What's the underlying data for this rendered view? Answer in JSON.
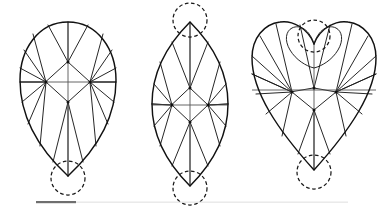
{
  "figure": {
    "background_color": "#ffffff",
    "outline_color": "#111111",
    "facet_color": "#1a1a1a",
    "axis_color": "#555555",
    "guide_circle_color": "#1a1a1a",
    "shapes": [
      {
        "id": "pear",
        "name": "Pear cut",
        "label": "",
        "center_x": 68,
        "outline_path": "M 68 22 C 98 22 116 50 116 80 C 116 118 96 150 68 176 C 40 150 20 118 20 80 C 20 50 38 22 68 22 Z",
        "nodes": [
          {
            "name": "upper-node",
            "x": 68,
            "y": 62
          },
          {
            "name": "left-node",
            "x": 46,
            "y": 82
          },
          {
            "name": "right-node",
            "x": 90,
            "y": 82
          },
          {
            "name": "lower-node",
            "x": 68,
            "y": 102
          }
        ],
        "guide_circles": [
          {
            "name": "bottom-point-circle",
            "cx": 68,
            "cy": 178,
            "r": 17
          }
        ],
        "axes": [
          {
            "name": "vertical-axis",
            "x1": 68,
            "y1": 22,
            "x2": 68,
            "y2": 177
          },
          {
            "name": "horizontal-axis",
            "x1": 20,
            "y1": 82,
            "x2": 116,
            "y2": 82
          }
        ],
        "rim_points_upper": [
          {
            "x": 68,
            "y": 22
          },
          {
            "x": 88,
            "y": 25
          },
          {
            "x": 103,
            "y": 34
          },
          {
            "x": 112,
            "y": 50
          },
          {
            "x": 116,
            "y": 68
          },
          {
            "x": 116,
            "y": 82
          },
          {
            "x": 20,
            "y": 82
          },
          {
            "x": 20,
            "y": 68
          },
          {
            "x": 24,
            "y": 50
          },
          {
            "x": 33,
            "y": 34
          },
          {
            "x": 48,
            "y": 25
          }
        ],
        "rim_points_lower": [
          {
            "x": 116,
            "y": 82
          },
          {
            "x": 114,
            "y": 102
          },
          {
            "x": 108,
            "y": 124
          },
          {
            "x": 96,
            "y": 146
          },
          {
            "x": 83,
            "y": 162
          },
          {
            "x": 68,
            "y": 176
          },
          {
            "x": 53,
            "y": 162
          },
          {
            "x": 40,
            "y": 146
          },
          {
            "x": 28,
            "y": 124
          },
          {
            "x": 22,
            "y": 102
          },
          {
            "x": 20,
            "y": 82
          }
        ]
      },
      {
        "id": "marquise",
        "name": "Marquise (navette) cut",
        "label": "",
        "center_x": 190,
        "outline_path": "M 190 22 C 216 48 228 76 228 104 C 228 132 216 160 190 186 C 164 160 152 132 152 104 C 152 76 164 48 190 22 Z",
        "nodes": [
          {
            "name": "upper-node",
            "x": 190,
            "y": 88
          },
          {
            "name": "left-node",
            "x": 172,
            "y": 105
          },
          {
            "name": "right-node",
            "x": 208,
            "y": 105
          },
          {
            "name": "lower-node",
            "x": 190,
            "y": 122
          }
        ],
        "guide_circles": [
          {
            "name": "top-point-circle",
            "cx": 190,
            "cy": 20,
            "r": 17
          },
          {
            "name": "bottom-point-circle",
            "cx": 190,
            "cy": 188,
            "r": 17
          }
        ],
        "axes": [
          {
            "name": "vertical-axis",
            "x1": 190,
            "y1": 22,
            "x2": 190,
            "y2": 186
          },
          {
            "name": "horizontal-axis",
            "x1": 152,
            "y1": 105,
            "x2": 228,
            "y2": 105
          }
        ],
        "rim_points_upper": [
          {
            "x": 190,
            "y": 22
          },
          {
            "x": 208,
            "y": 42
          },
          {
            "x": 220,
            "y": 62
          },
          {
            "x": 226,
            "y": 84
          },
          {
            "x": 228,
            "y": 104
          },
          {
            "x": 152,
            "y": 104
          },
          {
            "x": 154,
            "y": 84
          },
          {
            "x": 160,
            "y": 62
          },
          {
            "x": 172,
            "y": 42
          }
        ],
        "rim_points_lower": [
          {
            "x": 228,
            "y": 104
          },
          {
            "x": 226,
            "y": 126
          },
          {
            "x": 220,
            "y": 146
          },
          {
            "x": 208,
            "y": 166
          },
          {
            "x": 190,
            "y": 186
          },
          {
            "x": 172,
            "y": 166
          },
          {
            "x": 160,
            "y": 146
          },
          {
            "x": 154,
            "y": 126
          },
          {
            "x": 152,
            "y": 104
          }
        ]
      },
      {
        "id": "heart",
        "name": "Heart cut",
        "label": "",
        "center_x": 314,
        "outline_path": "M 314 44 C 320 28 336 20 348 22 C 364 24 376 38 376 58 C 376 92 350 130 314 170 C 278 130 252 92 252 58 C 252 38 264 24 280 22 C 292 20 308 28 314 44 Z",
        "cleft_path": "M 314 44 C 310 30 300 24 292 28 C 286 31 284 40 290 50 C 296 60 306 66 314 68 C 322 66 332 60 338 50 C 344 40 342 31 336 28 C 328 24 318 30 314 44 Z",
        "nodes": [
          {
            "name": "upper-node",
            "x": 314,
            "y": 88
          },
          {
            "name": "left-node",
            "x": 292,
            "y": 92
          },
          {
            "name": "right-node",
            "x": 336,
            "y": 92
          },
          {
            "name": "lower-node",
            "x": 314,
            "y": 110
          }
        ],
        "guide_circles": [
          {
            "name": "cleft-circle",
            "cx": 314,
            "cy": 36,
            "r": 16
          },
          {
            "name": "bottom-point-circle",
            "cx": 314,
            "cy": 172,
            "r": 17
          }
        ],
        "axes": [
          {
            "name": "vertical-axis",
            "x1": 314,
            "y1": 44,
            "x2": 314,
            "y2": 170
          },
          {
            "name": "horizontal-axis",
            "x1": 252,
            "y1": 90,
            "x2": 376,
            "y2": 90
          }
        ],
        "rim_points_upper": [
          {
            "x": 300,
            "y": 25
          },
          {
            "x": 330,
            "y": 25
          },
          {
            "x": 352,
            "y": 24
          },
          {
            "x": 368,
            "y": 36
          },
          {
            "x": 376,
            "y": 56
          },
          {
            "x": 376,
            "y": 74
          },
          {
            "x": 252,
            "y": 74
          },
          {
            "x": 252,
            "y": 56
          },
          {
            "x": 260,
            "y": 36
          },
          {
            "x": 276,
            "y": 24
          }
        ],
        "rim_points_lower": [
          {
            "x": 376,
            "y": 74
          },
          {
            "x": 372,
            "y": 94
          },
          {
            "x": 362,
            "y": 114
          },
          {
            "x": 346,
            "y": 136
          },
          {
            "x": 330,
            "y": 154
          },
          {
            "x": 314,
            "y": 170
          },
          {
            "x": 298,
            "y": 154
          },
          {
            "x": 282,
            "y": 136
          },
          {
            "x": 266,
            "y": 114
          },
          {
            "x": 256,
            "y": 94
          },
          {
            "x": 252,
            "y": 74
          }
        ]
      }
    ],
    "bottom_rule": {
      "name": "bottom-rule",
      "dark_segment": {
        "x": 36,
        "y": 201,
        "width": 40,
        "height": 2.2,
        "color": "#6f6f6f"
      },
      "light_segment": {
        "x": 76,
        "y": 201.6,
        "width": 272,
        "height": 1.1,
        "color": "#e2e2e2"
      }
    }
  }
}
